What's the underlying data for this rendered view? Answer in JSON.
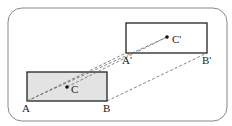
{
  "diagram": {
    "labels": {
      "A": "A",
      "B": "B",
      "C": "C",
      "A_prime": "A'",
      "B_prime": "B'",
      "C_prime": "C'"
    },
    "colors": {
      "frame": "#888888",
      "shape_stroke": "#222222",
      "original_fill": "#e3e3e3",
      "image_fill": "#ffffff",
      "dash": "#666666"
    }
  }
}
